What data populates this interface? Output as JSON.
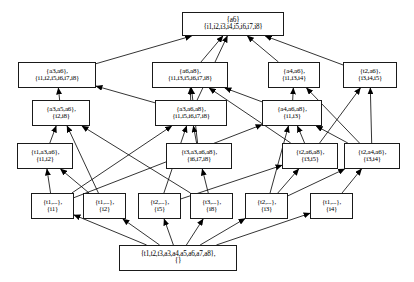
{
  "diagram": {
    "type": "lattice-hasse-diagram",
    "edge_color": "#000000",
    "node_border_color": "#1a1a1a",
    "node_fill_color": "#ffffff",
    "arrow_direction": "upward",
    "levels": 6,
    "node_count": 16,
    "edge_count": 34
  },
  "nodes": [
    {
      "id": "top",
      "extent": "{a6}",
      "intent": "{i1,i2,i3,i4,i5,i6,i7,i8}",
      "x": 182,
      "y": 12,
      "w": 102,
      "h": 24,
      "level": 0
    },
    {
      "id": "a3a6",
      "extent": "{a3,a6},",
      "intent": "{i1,i2,i5,i6,i7,i8}",
      "x": 18,
      "y": 62,
      "w": 78,
      "h": 26,
      "level": 1
    },
    {
      "id": "a6a8",
      "extent": "{a6,a8},",
      "intent": "{i1,i3,i5,i6,i7,i8}",
      "x": 152,
      "y": 62,
      "w": 76,
      "h": 26,
      "level": 1
    },
    {
      "id": "a4a6",
      "extent": "{a4,a6},",
      "intent": "{i1,i3,i4}",
      "x": 268,
      "y": 62,
      "w": 52,
      "h": 26,
      "level": 1
    },
    {
      "id": "t2a6",
      "extent": "{t2,a6},",
      "intent": "{i3,i4,i5}",
      "x": 343,
      "y": 62,
      "w": 54,
      "h": 26,
      "level": 1
    },
    {
      "id": "a3a5a6",
      "extent": "{a3,a5,a6},",
      "intent": "{i2,i8}",
      "x": 32,
      "y": 100,
      "w": 58,
      "h": 26,
      "level": 2
    },
    {
      "id": "a3a6a8",
      "extent": "{a3,a6,a8},",
      "intent": "{i1,i5,i6,i7,i8}",
      "x": 155,
      "y": 100,
      "w": 72,
      "h": 26,
      "level": 2
    },
    {
      "id": "a4a6a8",
      "extent": "{a4,a6,a8},",
      "intent": "{i1,i3}",
      "x": 262,
      "y": 100,
      "w": 60,
      "h": 26,
      "level": 2
    },
    {
      "id": "t1a3a6",
      "extent": "{t1,a3,a6},",
      "intent": "{i1,i2}",
      "x": 17,
      "y": 143,
      "w": 56,
      "h": 26,
      "level": 3
    },
    {
      "id": "t3a3a6a8",
      "extent": "{t3,a3,a6,a8},",
      "intent": "{i6,i7,i8}",
      "x": 166,
      "y": 143,
      "w": 66,
      "h": 26,
      "level": 3
    },
    {
      "id": "t2a6a8",
      "extent": "{t2,a6,a8},",
      "intent": "{i3,i5}",
      "x": 282,
      "y": 143,
      "w": 56,
      "h": 26,
      "level": 3
    },
    {
      "id": "t2a4a6",
      "extent": "{t2,a4,a6},",
      "intent": "{i3,i4}",
      "x": 344,
      "y": 143,
      "w": 56,
      "h": 26,
      "level": 3
    },
    {
      "id": "i1",
      "extent": "{t1,...},",
      "intent": "{i1}",
      "x": 31,
      "y": 193,
      "w": 43,
      "h": 26,
      "level": 4
    },
    {
      "id": "i2",
      "extent": "{t1,...},",
      "intent": "{i2}",
      "x": 83,
      "y": 193,
      "w": 43,
      "h": 26,
      "level": 4
    },
    {
      "id": "i5",
      "extent": "{t2,...},",
      "intent": "{i5}",
      "x": 138,
      "y": 193,
      "w": 43,
      "h": 26,
      "level": 4
    },
    {
      "id": "i8",
      "extent": "{t3,...},",
      "intent": "{i8}",
      "x": 190,
      "y": 193,
      "w": 43,
      "h": 26,
      "level": 4
    },
    {
      "id": "i3",
      "extent": "{t2,...},",
      "intent": "{i3}",
      "x": 245,
      "y": 193,
      "w": 43,
      "h": 26,
      "level": 4
    },
    {
      "id": "i4",
      "extent": "{t1,...},",
      "intent": "{i4}",
      "x": 310,
      "y": 193,
      "w": 43,
      "h": 26,
      "level": 4
    },
    {
      "id": "bottom",
      "extent": "{t1,t2,t3,a3,a4,a5,a6,a7,a8},",
      "intent": "{}",
      "x": 119,
      "y": 245,
      "w": 118,
      "h": 26,
      "level": 5
    }
  ],
  "edges": [
    {
      "from": "a3a6",
      "to": "top"
    },
    {
      "from": "a6a8",
      "to": "top"
    },
    {
      "from": "a4a6",
      "to": "top"
    },
    {
      "from": "t2a6",
      "to": "top"
    },
    {
      "from": "a3a6a8",
      "to": "top"
    },
    {
      "from": "a3a5a6",
      "to": "a3a6"
    },
    {
      "from": "a3a6a8",
      "to": "a3a6"
    },
    {
      "from": "a3a6a8",
      "to": "a6a8"
    },
    {
      "from": "a4a6a8",
      "to": "a6a8"
    },
    {
      "from": "t3a3a6a8",
      "to": "a6a8"
    },
    {
      "from": "t2a6a8",
      "to": "a6a8"
    },
    {
      "from": "a4a6a8",
      "to": "a4a6"
    },
    {
      "from": "t2a4a6",
      "to": "a4a6"
    },
    {
      "from": "t2a6a8",
      "to": "t2a6"
    },
    {
      "from": "t2a4a6",
      "to": "t2a6"
    },
    {
      "from": "t1a3a6",
      "to": "a3a5a6"
    },
    {
      "from": "i2",
      "to": "a3a5a6"
    },
    {
      "from": "i8",
      "to": "a3a5a6"
    },
    {
      "from": "t3a3a6a8",
      "to": "a3a6a8"
    },
    {
      "from": "i1",
      "to": "a3a6a8"
    },
    {
      "from": "i5",
      "to": "a3a6a8"
    },
    {
      "from": "t2a6a8",
      "to": "a4a6a8"
    },
    {
      "from": "t2a4a6",
      "to": "a4a6a8"
    },
    {
      "from": "i1",
      "to": "a4a6a8"
    },
    {
      "from": "i3",
      "to": "a4a6a8"
    },
    {
      "from": "i1",
      "to": "t1a3a6"
    },
    {
      "from": "i2",
      "to": "t1a3a6"
    },
    {
      "from": "i8",
      "to": "t3a3a6a8"
    },
    {
      "from": "i3",
      "to": "t2a6a8"
    },
    {
      "from": "i5",
      "to": "t2a6a8"
    },
    {
      "from": "i3",
      "to": "t2a4a6"
    },
    {
      "from": "i4",
      "to": "t2a4a6"
    },
    {
      "from": "bottom",
      "to": "i1"
    },
    {
      "from": "bottom",
      "to": "i2"
    },
    {
      "from": "bottom",
      "to": "i5"
    },
    {
      "from": "bottom",
      "to": "i8"
    },
    {
      "from": "bottom",
      "to": "i3"
    },
    {
      "from": "bottom",
      "to": "i4"
    }
  ]
}
